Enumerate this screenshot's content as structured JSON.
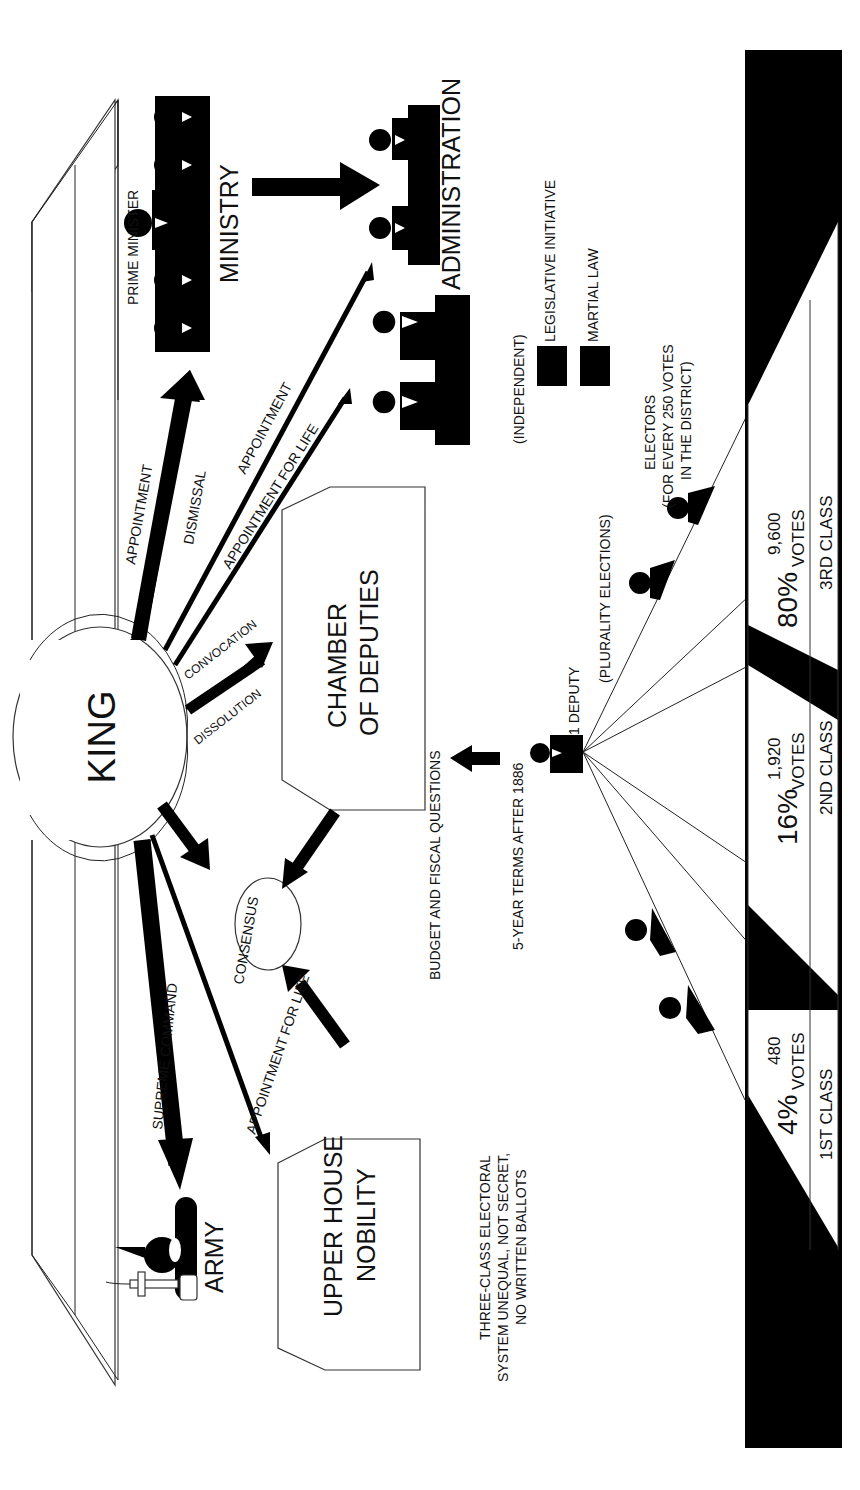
{
  "diagram": {
    "orientation": "rotated-90-ccw",
    "colors": {
      "ink": "#000000",
      "paper": "#ffffff",
      "line": "#333333"
    },
    "center": {
      "label": "KING"
    },
    "nodes": {
      "ministry": {
        "label": "MINISTRY",
        "head_label": "PRIME MINISTER"
      },
      "administration": {
        "label": "ADMINISTRATION"
      },
      "judiciary": {
        "note": "(INDEPENDENT)"
      },
      "chamber": {
        "line1": "CHAMBER",
        "line2": "OF DEPUTIES"
      },
      "upper_house": {
        "line1": "UPPER HOUSE",
        "line2": "NOBILITY"
      },
      "army": {
        "label": "ARMY"
      },
      "consensus": {
        "label": "CONSENSUS"
      }
    },
    "edges": {
      "ministry_appointment": "APPOINTMENT",
      "ministry_dismissal": "DISMISSAL",
      "admin_appointment": "APPOINTMENT",
      "judiciary_appointment": "APPOINTMENT FOR LIFE",
      "chamber_convocation": "CONVOCATION",
      "chamber_dissolution": "DISSOLUTION",
      "army_command": "SUPREME COMMAND",
      "upper_appointment": "APPOINTMENT FOR LIFE",
      "budget": "BUDGET AND FISCAL QUESTIONS",
      "terms": "5-YEAR TERMS AFTER 1886"
    },
    "legend": [
      {
        "label": "LEGISLATIVE INITIATIVE"
      },
      {
        "label": "MARTIAL LAW"
      }
    ],
    "election": {
      "deputy": "1 DEPUTY",
      "method": "(PLURALITY ELECTIONS)",
      "electors_line1": "ELECTORS",
      "electors_line2": "(FOR EVERY 250 VOTES",
      "electors_line3": "IN THE DISTRICT)",
      "system_line1": "THREE-CLASS ELECTORAL",
      "system_line2": "SYSTEM UNEQUAL, NOT SECRET,",
      "system_line3": "NO WRITTEN BALLOTS"
    },
    "classes": [
      {
        "name": "1ST CLASS",
        "percent": "4%",
        "votes_word": "VOTES",
        "votes": "480"
      },
      {
        "name": "2ND CLASS",
        "percent": "16%",
        "votes_word": "VOTES",
        "votes": "1,920"
      },
      {
        "name": "3RD CLASS",
        "percent": "80%",
        "votes_word": "VOTES",
        "votes": "9,600"
      }
    ]
  }
}
